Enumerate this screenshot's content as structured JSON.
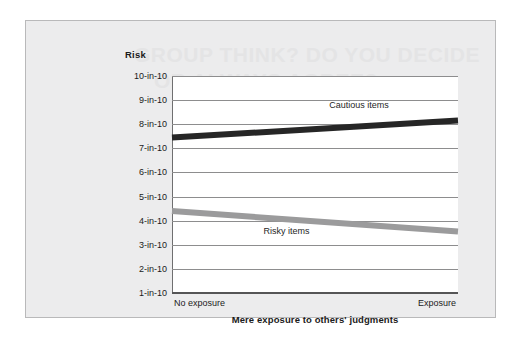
{
  "figure": {
    "background_color": "#ececed",
    "border_color": "#b9b9ba",
    "plot_background_color": "#ffffff",
    "gridline_color": "#8d8d8e"
  },
  "ghost_text": {
    "line1": "GROUP THINK? DO YOU DECIDE",
    "line2": "OR ALWAYS AGREE?"
  },
  "axes": {
    "y_title": "Risk",
    "x_title": "Mere exposure to others' judgments",
    "y_ticks": [
      "10-in-10",
      "9-in-10",
      "8-in-10",
      "7-in-10",
      "6-in-10",
      "5-in-10",
      "4-in-10",
      "3-in-10",
      "2-in-10",
      "1-in-10"
    ],
    "x_ticks": [
      "No exposure",
      "Exposure"
    ]
  },
  "chart_data": {
    "type": "line",
    "title": "",
    "xlabel": "Mere exposure to others' judgments",
    "ylabel": "Risk",
    "categories": [
      "No exposure",
      "Exposure"
    ],
    "x": [
      0,
      1
    ],
    "ylim": [
      1,
      10
    ],
    "yticklabels": [
      "1-in-10",
      "2-in-10",
      "3-in-10",
      "4-in-10",
      "5-in-10",
      "6-in-10",
      "7-in-10",
      "8-in-10",
      "9-in-10",
      "10-in-10"
    ],
    "yticks": [
      1,
      2,
      3,
      4,
      5,
      6,
      7,
      8,
      9,
      10
    ],
    "grid": true,
    "legend": "inline-labels",
    "series": [
      {
        "name": "Cautious items",
        "values": [
          7.45,
          8.15
        ],
        "color": "#262626",
        "linewidth": 6
      },
      {
        "name": "Risky items",
        "values": [
          4.4,
          3.55
        ],
        "color": "#9b9b9c",
        "linewidth": 6
      }
    ],
    "annotations": [
      {
        "text": "Cautious items",
        "x": 0.55,
        "y": 8.75
      },
      {
        "text": "Risky items",
        "x": 0.32,
        "y": 3.55
      }
    ]
  }
}
